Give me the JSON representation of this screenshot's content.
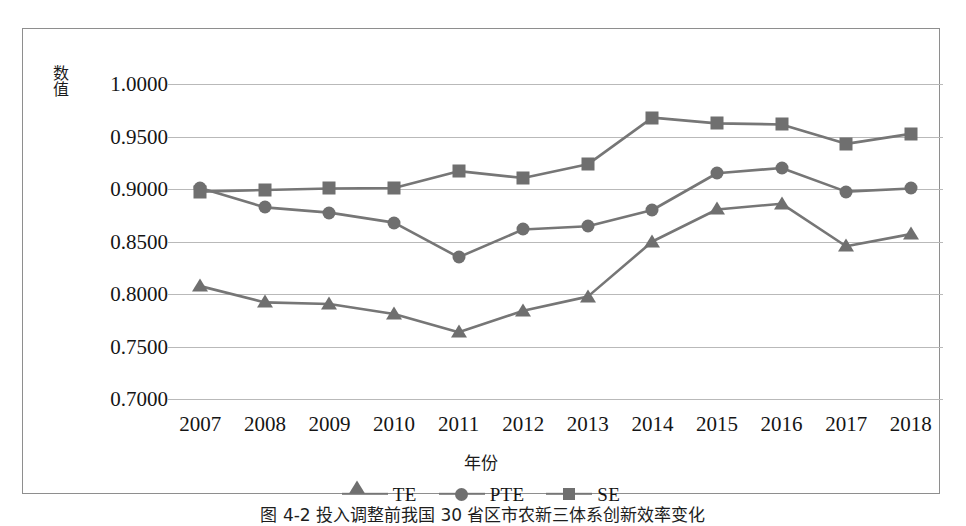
{
  "figure": {
    "caption": "图 4-2  投入调整前我国 30 省区市农新三体系创新效率变化"
  },
  "chart_data": {
    "type": "line",
    "title": "",
    "xlabel": "年份",
    "ylabel": "数值",
    "categories": [
      "2007",
      "2008",
      "2009",
      "2010",
      "2011",
      "2012",
      "2013",
      "2014",
      "2015",
      "2016",
      "2017",
      "2018"
    ],
    "ylim": [
      0.7,
      1.0
    ],
    "ytick_labels": [
      "1.0000",
      "0.9500",
      "0.9000",
      "0.8500",
      "0.8000",
      "0.7500",
      "0.7000"
    ],
    "ytick_values": [
      1.0,
      0.95,
      0.9,
      0.85,
      0.8,
      0.75,
      0.7
    ],
    "grid": true,
    "legend_position": "bottom",
    "line_color": "#767676",
    "marker_color": "#6f6f6f",
    "series": [
      {
        "name": "TE",
        "marker": "triangle",
        "values": [
          0.8075,
          0.792,
          0.7905,
          0.781,
          0.7635,
          0.784,
          0.7975,
          0.85,
          0.8805,
          0.886,
          0.8455,
          0.857
        ]
      },
      {
        "name": "PTE",
        "marker": "circle",
        "values": [
          0.901,
          0.8825,
          0.8775,
          0.868,
          0.835,
          0.8615,
          0.8645,
          0.88,
          0.915,
          0.92,
          0.8975,
          0.9005
        ]
      },
      {
        "name": "SE",
        "marker": "square",
        "values": [
          0.8975,
          0.899,
          0.9005,
          0.901,
          0.917,
          0.9105,
          0.9235,
          0.968,
          0.9625,
          0.9615,
          0.943,
          0.9525
        ]
      }
    ]
  }
}
